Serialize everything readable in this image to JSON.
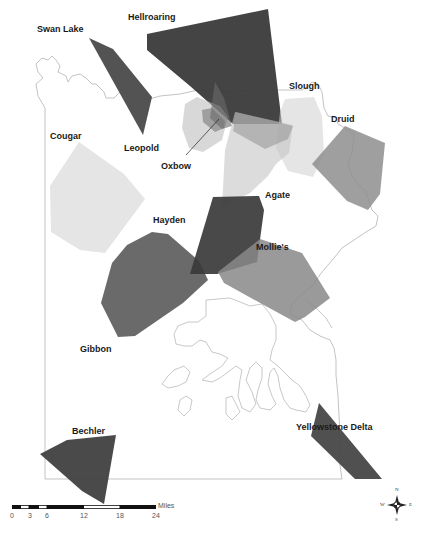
{
  "map": {
    "territories": [
      {
        "name": "Hellroaring",
        "label": "Hellroaring",
        "shade": "#3a3a3a",
        "opacity": 0.95,
        "points": "147,34 268,9 282,124 233,124 190,86 147,50"
      },
      {
        "name": "Swan Lake",
        "label": "Swan Lake",
        "shade": "#4a4a4a",
        "opacity": 0.95,
        "points": "89,38 113,49 152,97 143,135"
      },
      {
        "name": "Leopold",
        "label": "Leopold",
        "shade": "#b8b8b8",
        "opacity": 0.55,
        "points": "185,104 197,97 220,106 228,117 222,140 203,152 189,148 182,128"
      },
      {
        "name": "Oxbow",
        "label": "Oxbow",
        "shade": "#7a7a7a",
        "opacity": 0.6,
        "points": "202,110 212,108 225,121 224,128 215,132 203,122"
      },
      {
        "name": "Oxbow-core",
        "label": "",
        "shade": "#6a6a6a",
        "opacity": 0.6,
        "points": "215,82 224,98 232,126 222,129 210,118"
      },
      {
        "name": "Slough",
        "label": "Slough",
        "shade": "#cfcfcf",
        "opacity": 0.55,
        "points": "285,99 314,97 322,116 324,154 313,177 288,171 276,148 280,112"
      },
      {
        "name": "Druid",
        "label": "Druid",
        "shade": "#8e8e8e",
        "opacity": 0.85,
        "points": "312,164 345,126 385,143 380,194 368,210 347,201"
      },
      {
        "name": "Agate",
        "label": "Agate",
        "shade": "#c4c4c4",
        "opacity": 0.6,
        "points": "235,112 293,125 289,153 276,164 268,176 250,193 222,208 225,150"
      },
      {
        "name": "Agate-upper",
        "label": "",
        "shade": "#9a9a9a",
        "opacity": 0.6,
        "points": "236,112 293,126 288,139 265,149 233,131"
      },
      {
        "name": "Cougar",
        "label": "Cougar",
        "shade": "#dcdcdc",
        "opacity": 0.75,
        "points": "50,186 79,142 124,174 145,199 105,253 80,250 51,232"
      },
      {
        "name": "Hayden",
        "label": "Hayden",
        "shade": "#5a5a5a",
        "opacity": 0.9,
        "points": "101,303 112,263 127,245 152,232 168,234 199,261 208,280 183,303 135,336 118,337"
      },
      {
        "name": "Agate-south",
        "label": "",
        "shade": "#3a3a3a",
        "opacity": 0.92,
        "points": "190,274 213,197 259,196 264,210 257,262 217,274"
      },
      {
        "name": "Mollie's",
        "label": "Mollie's",
        "shade": "#888888",
        "opacity": 0.85,
        "points": "218,272 260,239 302,253 330,298 305,317 295,322 262,304 224,283"
      },
      {
        "name": "Bechler",
        "label": "Bechler",
        "shade": "#444444",
        "opacity": 0.97,
        "points": "40,454 67,440 116,435 104,504 82,491"
      },
      {
        "name": "Yellowstone Delta",
        "label": "Yellowstone Delta",
        "shade": "#4a4a4a",
        "opacity": 0.97,
        "points": "319,403 382,479 355,479 311,436"
      }
    ],
    "labels": [
      {
        "text": "Hellroaring",
        "x": 128,
        "y": 12
      },
      {
        "text": "Swan Lake",
        "x": 37,
        "y": 24
      },
      {
        "text": "Slough",
        "x": 289,
        "y": 81
      },
      {
        "text": "Druid",
        "x": 331,
        "y": 114
      },
      {
        "text": "Cougar",
        "x": 50,
        "y": 131
      },
      {
        "text": "Leopold",
        "x": 124,
        "y": 143
      },
      {
        "text": "Oxbow",
        "x": 161,
        "y": 161
      },
      {
        "text": "Agate",
        "x": 265,
        "y": 190
      },
      {
        "text": "Hayden",
        "x": 153,
        "y": 215
      },
      {
        "text": "Mollie's",
        "x": 256,
        "y": 242
      },
      {
        "text": "Gibbon",
        "x": 80,
        "y": 344
      },
      {
        "text": "Bechler",
        "x": 72,
        "y": 426
      },
      {
        "text": "Yellowstone Delta",
        "x": 296,
        "y": 422
      }
    ],
    "oxbow_leader": {
      "x1": 186,
      "y1": 155,
      "x2": 219,
      "y2": 119
    }
  },
  "scale_bar": {
    "unit": "Miles",
    "ticks": [
      "0",
      "3",
      "6",
      "12",
      "18",
      "24"
    ]
  },
  "compass": {
    "n": "N",
    "s": "S",
    "e": "E",
    "w": "W"
  }
}
